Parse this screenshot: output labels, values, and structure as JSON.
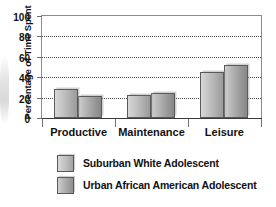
{
  "chart_data": {
    "type": "bar",
    "title": "",
    "xlabel": "",
    "ylabel": "Percentage of Time Spent",
    "categories": [
      "Productive",
      "Maintenance",
      "Leisure"
    ],
    "series": [
      {
        "name": "Suburban White Adolescent",
        "values": [
          29,
          23,
          45
        ]
      },
      {
        "name": "Urban African American Adolescent",
        "values": [
          22,
          25,
          52
        ]
      }
    ],
    "ylim": [
      0,
      100
    ],
    "yticks": [
      0,
      20,
      40,
      60,
      80,
      100
    ],
    "ytick_labels": [
      "0",
      "20",
      "40",
      "60",
      "80",
      "100"
    ],
    "grid": true,
    "grid_axis": "y",
    "grid_style": "dotted",
    "legend_position": "bottom-left",
    "bar_fill": "#bdbdbd",
    "bar_edge": "#5a5a5a",
    "axis_color": "#8c8c8c",
    "text_color": "#111111"
  },
  "legend": {
    "items": [
      {
        "label": "Suburban White Adolescent"
      },
      {
        "label": "Urban African American Adolescent"
      }
    ]
  }
}
